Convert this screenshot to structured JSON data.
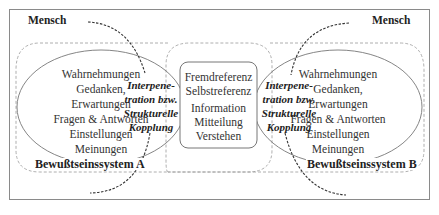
{
  "diagram": {
    "human_left_label": "Mensch",
    "human_right_label": "Mensch",
    "system_a": {
      "label": "Bewußtseinssystem A",
      "items": [
        "Wahrnehmungen",
        "Gedanken,",
        "Erwartungen",
        "Fragen & Antworten",
        "Einstellungen",
        "Meinungen"
      ]
    },
    "system_b": {
      "label": "Bewußtseinssystem B",
      "items": [
        "Wahrnehmungen",
        "Gedanken,",
        "Erwartungen",
        "Fragen & Antworten",
        "Einstellungen",
        "Meinungen"
      ]
    },
    "coupling_left": {
      "lines": [
        "Interpene-",
        "tration bzw.",
        "Strukturelle",
        "Kopplung"
      ]
    },
    "coupling_right": {
      "lines": [
        "Interpene-",
        "tration bzw.",
        "Strukturelle",
        "Kopplung"
      ]
    },
    "communication": {
      "reference_lines": [
        "Fremdreferenz",
        "Selbstreferenz"
      ],
      "process_lines": [
        "Information",
        "Mitteilung",
        "Verstehen"
      ]
    }
  },
  "colors": {
    "border": "#8a8a8a",
    "dashed": "#9a9a9a",
    "arrow": "#333333",
    "text": "#222222"
  }
}
